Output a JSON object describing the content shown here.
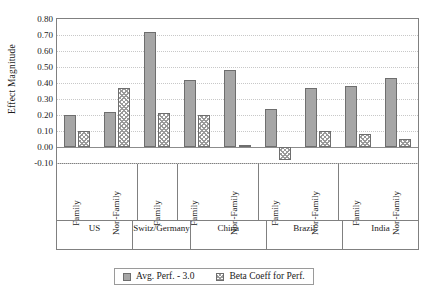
{
  "chart_data": {
    "type": "bar",
    "title": "",
    "xlabel": "",
    "ylabel": "Effect Magnitude",
    "ylim": [
      -0.1,
      0.8
    ],
    "ytick_step": 0.1,
    "ytick_labels": [
      "0.80",
      "0.70",
      "0.60",
      "0.50",
      "0.40",
      "0.30",
      "0.20",
      "0.10",
      "0.00",
      "-0.10"
    ],
    "ytick_values": [
      0.8,
      0.7,
      0.6,
      0.5,
      0.4,
      0.3,
      0.2,
      0.1,
      0.0,
      -0.1
    ],
    "grid": true,
    "legend_position": "bottom",
    "categories": [
      "Family",
      "Non-Family",
      "Family",
      "Family",
      "Non-Family",
      "Family",
      "Non-Family",
      "Family",
      "Non-Family"
    ],
    "groups": [
      {
        "label": "US",
        "span": 2
      },
      {
        "label": "Switz/ Germany",
        "span": 1
      },
      {
        "label": "China",
        "span": 2
      },
      {
        "label": "Brazil",
        "span": 2
      },
      {
        "label": "India",
        "span": 2
      }
    ],
    "series": [
      {
        "name": "Avg. Perf. - 3.0",
        "style": "solid",
        "color": "#a6a6a6",
        "values": [
          0.2,
          0.22,
          0.72,
          0.42,
          0.48,
          0.24,
          0.37,
          0.38,
          0.43
        ]
      },
      {
        "name": "Beta Coeff for Perf.",
        "style": "hatched",
        "color": "#9a9a9a",
        "values": [
          0.1,
          0.37,
          0.21,
          0.2,
          0.01,
          -0.08,
          0.1,
          0.08,
          0.05
        ]
      }
    ],
    "legend": [
      "Avg. Perf. - 3.0",
      "Beta Coeff for Perf."
    ]
  },
  "axis": {
    "y_title": "Effect Magnitude"
  },
  "colors": {
    "bar_solid": "#a6a6a6",
    "bar_hatch": "#9a9a9a",
    "bar_border": "#6e6e6e",
    "grid": "#c8c8c8",
    "axis": "#808080",
    "text": "#1a1a1a"
  }
}
